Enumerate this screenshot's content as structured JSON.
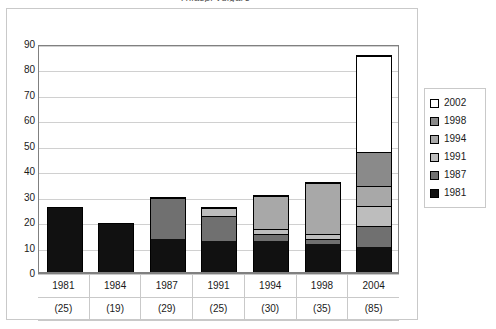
{
  "chart_data": {
    "type": "bar",
    "subtype": "stacked-bar",
    "title": "Thlaspi vulgare",
    "xlabel": "",
    "ylabel": "",
    "ylim": [
      0,
      90
    ],
    "ytick_step": 10,
    "yticks": [
      "90",
      "80",
      "70",
      "60",
      "50",
      "40",
      "30",
      "20",
      "10",
      "0"
    ],
    "grid": true,
    "legend_position": "right",
    "categories": [
      "1981",
      "1984",
      "1987",
      "1991",
      "1994",
      "1998",
      "2004"
    ],
    "category_totals": [
      "(25)",
      "(19)",
      "(29)",
      "(25)",
      "(30)",
      "(35)",
      "(85)"
    ],
    "totals": [
      25,
      19,
      29,
      25,
      30,
      35,
      85
    ],
    "series": [
      {
        "name": "1981",
        "color": "#111111",
        "values": [
          25,
          19,
          13,
          12,
          12,
          11,
          10
        ]
      },
      {
        "name": "1987",
        "color": "#707070",
        "values": [
          0,
          0,
          16,
          10,
          3,
          2,
          8
        ]
      },
      {
        "name": "1991",
        "color": "#bdbdbd",
        "values": [
          0,
          0,
          0,
          3,
          2,
          2,
          8
        ]
      },
      {
        "name": "1994",
        "color": "#a8a8a8",
        "values": [
          0,
          0,
          0,
          0,
          13,
          20,
          8
        ]
      },
      {
        "name": "1998",
        "color": "#8a8a8a",
        "values": [
          0,
          0,
          0,
          0,
          0,
          0,
          13
        ]
      },
      {
        "name": "2002",
        "color": "#ffffff",
        "values": [
          0,
          0,
          0,
          0,
          0,
          0,
          38
        ]
      }
    ],
    "legend": [
      {
        "label": "2002",
        "color": "#ffffff"
      },
      {
        "label": "1998",
        "color": "#8a8a8a"
      },
      {
        "label": "1994",
        "color": "#a8a8a8"
      },
      {
        "label": "1991",
        "color": "#bdbdbd"
      },
      {
        "label": "1987",
        "color": "#707070"
      },
      {
        "label": "1981",
        "color": "#111111"
      }
    ]
  },
  "axis": {
    "y": {
      "ticks": [
        "90",
        "80",
        "70",
        "60",
        "50",
        "40",
        "30",
        "20",
        "10",
        "0"
      ]
    },
    "x": {
      "years": [
        "1981",
        "1984",
        "1987",
        "1991",
        "1994",
        "1998",
        "2004"
      ],
      "counts": [
        "(25)",
        "(19)",
        "(29)",
        "(25)",
        "(30)",
        "(35)",
        "(85)"
      ]
    }
  },
  "colors": {
    "grid": "#d0d0d0",
    "axis": "#808080",
    "frame": "#c9c9c9",
    "bar_outline": "#000000"
  }
}
